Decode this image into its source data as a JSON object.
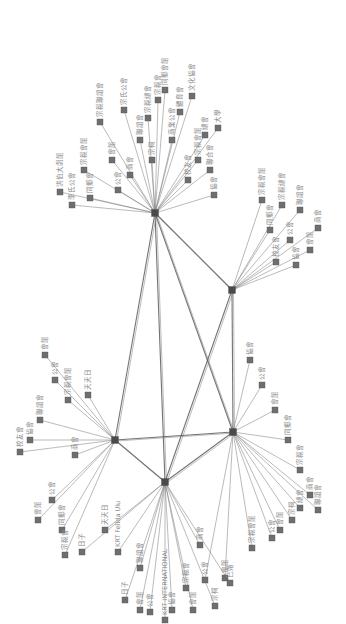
{
  "diagram": {
    "type": "network",
    "orientation": "rotated-90",
    "colors": {
      "node": "#6e6e6e",
      "hub": "#4a4a4a",
      "edge": "#7a7a7a",
      "label": "#8a8a8a",
      "background": "#ffffff"
    },
    "hubs": [
      {
        "id": "h1",
        "x": 155,
        "y": 213
      },
      {
        "id": "h2",
        "x": 232,
        "y": 290
      },
      {
        "id": "h3",
        "x": 233,
        "y": 432
      },
      {
        "id": "h4",
        "x": 165,
        "y": 482
      },
      {
        "id": "h5",
        "x": 115,
        "y": 440
      }
    ],
    "hub_links": [
      [
        "h1",
        "h2"
      ],
      [
        "h1",
        "h4"
      ],
      [
        "h1",
        "h3"
      ],
      [
        "h2",
        "h3"
      ],
      [
        "h2",
        "h4"
      ],
      [
        "h4",
        "h5"
      ],
      [
        "h4",
        "h3"
      ],
      [
        "h5",
        "h3"
      ],
      [
        "h1",
        "h5"
      ]
    ],
    "nodes": [
      {
        "hub": "h1",
        "x": 60,
        "y": 192,
        "label": "洪伯大劇館"
      },
      {
        "hub": "h1",
        "x": 72,
        "y": 205,
        "label": "李氏公會"
      },
      {
        "hub": "h1",
        "x": 84,
        "y": 170,
        "label": "宗親會館"
      },
      {
        "hub": "h1",
        "x": 90,
        "y": 198,
        "label": "同鄉會"
      },
      {
        "hub": "h1",
        "x": 100,
        "y": 122,
        "label": "宗親聯誼會"
      },
      {
        "hub": "h1",
        "x": 112,
        "y": 160,
        "label": "會館"
      },
      {
        "hub": "h1",
        "x": 118,
        "y": 190,
        "label": "公會"
      },
      {
        "hub": "h1",
        "x": 124,
        "y": 110,
        "label": "宗氏公會"
      },
      {
        "hub": "h1",
        "x": 130,
        "y": 175,
        "label": "商會"
      },
      {
        "hub": "h1",
        "x": 140,
        "y": 140,
        "label": "聯誼會"
      },
      {
        "hub": "h1",
        "x": 148,
        "y": 118,
        "label": "宗親總會"
      },
      {
        "hub": "h1",
        "x": 152,
        "y": 160,
        "label": "宗祠"
      },
      {
        "hub": "h1",
        "x": 158,
        "y": 100,
        "label": "宗親會"
      },
      {
        "hub": "h1",
        "x": 165,
        "y": 90,
        "label": "同鄉會館"
      },
      {
        "hub": "h1",
        "x": 172,
        "y": 140,
        "label": "商業公會"
      },
      {
        "hub": "h1",
        "x": 180,
        "y": 112,
        "label": "體育會"
      },
      {
        "hub": "h1",
        "x": 188,
        "y": 180,
        "label": "校友會"
      },
      {
        "hub": "h1",
        "x": 192,
        "y": 96,
        "label": "文化協會"
      },
      {
        "hub": "h1",
        "x": 198,
        "y": 160,
        "label": "宗親會館"
      },
      {
        "hub": "h1",
        "x": 205,
        "y": 135,
        "label": "總會"
      },
      {
        "hub": "h1",
        "x": 210,
        "y": 170,
        "label": "聯合會"
      },
      {
        "hub": "h1",
        "x": 218,
        "y": 128,
        "label": "大學"
      },
      {
        "hub": "h1",
        "x": 214,
        "y": 195,
        "label": "協會"
      },
      {
        "hub": "h2",
        "x": 262,
        "y": 200,
        "label": "宗親會館"
      },
      {
        "hub": "h2",
        "x": 270,
        "y": 230,
        "label": "同鄉會"
      },
      {
        "hub": "h2",
        "x": 282,
        "y": 205,
        "label": "宗親總會"
      },
      {
        "hub": "h2",
        "x": 290,
        "y": 240,
        "label": "公會"
      },
      {
        "hub": "h2",
        "x": 300,
        "y": 210,
        "label": "聯誼會"
      },
      {
        "hub": "h2",
        "x": 310,
        "y": 250,
        "label": "會館"
      },
      {
        "hub": "h2",
        "x": 318,
        "y": 228,
        "label": "商會"
      },
      {
        "hub": "h2",
        "x": 296,
        "y": 265,
        "label": "協會"
      },
      {
        "hub": "h2",
        "x": 276,
        "y": 262,
        "label": "校友會"
      },
      {
        "hub": "h3",
        "x": 250,
        "y": 360,
        "label": "協會"
      },
      {
        "hub": "h3",
        "x": 262,
        "y": 385,
        "label": "公會"
      },
      {
        "hub": "h3",
        "x": 275,
        "y": 410,
        "label": "會館"
      },
      {
        "hub": "h3",
        "x": 288,
        "y": 440,
        "label": "同鄉會"
      },
      {
        "hub": "h3",
        "x": 300,
        "y": 470,
        "label": "宗親會"
      },
      {
        "hub": "h3",
        "x": 310,
        "y": 495,
        "label": "商會"
      },
      {
        "hub": "h3",
        "x": 318,
        "y": 510,
        "label": "聯誼會"
      },
      {
        "hub": "h3",
        "x": 300,
        "y": 508,
        "label": "總會"
      },
      {
        "hub": "h3",
        "x": 292,
        "y": 520,
        "label": "宗祠"
      },
      {
        "hub": "h3",
        "x": 280,
        "y": 530,
        "label": "會館"
      },
      {
        "hub": "h3",
        "x": 272,
        "y": 538,
        "label": "公會"
      },
      {
        "hub": "h3",
        "x": 252,
        "y": 548,
        "label": "宗親會館"
      },
      {
        "hub": "h3",
        "x": 225,
        "y": 578,
        "label": "會館"
      },
      {
        "hub": "h3",
        "x": 205,
        "y": 580,
        "label": "公會"
      },
      {
        "hub": "h4",
        "x": 105,
        "y": 530,
        "label": "天天日"
      },
      {
        "hub": "h4",
        "x": 82,
        "y": 552,
        "label": "日子"
      },
      {
        "hub": "h4",
        "x": 118,
        "y": 552,
        "label": "KRT Felida Ulu"
      },
      {
        "hub": "h4",
        "x": 125,
        "y": 600,
        "label": "日子"
      },
      {
        "hub": "h4",
        "x": 140,
        "y": 610,
        "label": "會館"
      },
      {
        "hub": "h4",
        "x": 150,
        "y": 612,
        "label": "公會"
      },
      {
        "hub": "h4",
        "x": 165,
        "y": 620,
        "label": "KRT INTERNATIONAL"
      },
      {
        "hub": "h4",
        "x": 172,
        "y": 610,
        "label": "協會"
      },
      {
        "hub": "h4",
        "x": 186,
        "y": 588,
        "label": "宗親會"
      },
      {
        "hub": "h4",
        "x": 193,
        "y": 610,
        "label": "會館"
      },
      {
        "hub": "h4",
        "x": 215,
        "y": 606,
        "label": "宗祠"
      },
      {
        "hub": "h4",
        "x": 230,
        "y": 583,
        "label": "已婚"
      },
      {
        "hub": "h4",
        "x": 200,
        "y": 545,
        "label": "商會"
      },
      {
        "hub": "h4",
        "x": 140,
        "y": 568,
        "label": "聯誼會"
      },
      {
        "hub": "h5",
        "x": 20,
        "y": 452,
        "label": "校友會"
      },
      {
        "hub": "h5",
        "x": 38,
        "y": 520,
        "label": "會館"
      },
      {
        "hub": "h5",
        "x": 52,
        "y": 500,
        "label": "公會"
      },
      {
        "hub": "h5",
        "x": 62,
        "y": 530,
        "label": "同鄉會"
      },
      {
        "hub": "h5",
        "x": 65,
        "y": 555,
        "label": "宗親會"
      },
      {
        "hub": "h5",
        "x": 75,
        "y": 455,
        "label": "商會"
      },
      {
        "hub": "h5",
        "x": 88,
        "y": 395,
        "label": "天天日"
      },
      {
        "hub": "h5",
        "x": 45,
        "y": 355,
        "label": "會館"
      },
      {
        "hub": "h5",
        "x": 55,
        "y": 380,
        "label": "公會"
      },
      {
        "hub": "h5",
        "x": 68,
        "y": 400,
        "label": "宗親會館"
      },
      {
        "hub": "h5",
        "x": 40,
        "y": 420,
        "label": "聯誼會"
      },
      {
        "hub": "h5",
        "x": 30,
        "y": 440,
        "label": "協會"
      }
    ]
  }
}
